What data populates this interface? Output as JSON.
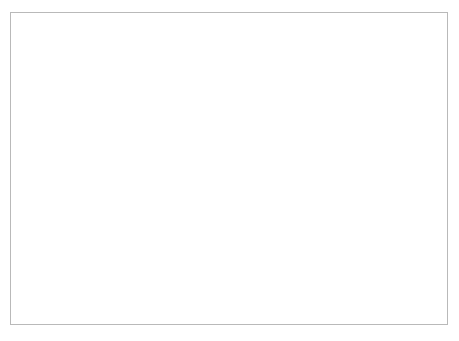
{
  "chart_data": {
    "type": "line",
    "title": "",
    "xlabel": "",
    "ylabel": "(g or ml) / person / week",
    "xlim": [
      1974,
      2006
    ],
    "ylim": [
      0,
      3500
    ],
    "yticks": [
      "0",
      "500",
      "1,000",
      "1,500",
      "2,000",
      "2,500",
      "3,000",
      "3,500"
    ],
    "ytick_values": [
      0,
      500,
      1000,
      1500,
      2000,
      2500,
      3000,
      3500
    ],
    "xticks": [
      "1974",
      "1976",
      "1978",
      "1980",
      "1982",
      "1984",
      "1986",
      "1988",
      "1990",
      "1992",
      "1994",
      "1996",
      "1998",
      "2000",
      "2002",
      "2004",
      "2006"
    ],
    "xtick_values": [
      1974,
      1976,
      1978,
      1980,
      1982,
      1984,
      1986,
      1988,
      1990,
      1992,
      1994,
      1996,
      1998,
      2000,
      2002,
      2004,
      2006
    ],
    "minor_xticks": [
      1975,
      1977,
      1979,
      1981,
      1983,
      1985,
      1987,
      1989,
      1991,
      1993,
      1995,
      1997,
      1999,
      2001,
      2003,
      2005
    ],
    "grid": false,
    "legend_position": "inline-labels",
    "x": [
      1974,
      1975,
      1976,
      1977,
      1978,
      1979,
      1980,
      1981,
      1982,
      1983,
      1984,
      1985,
      1986,
      1987,
      1988,
      1989,
      1990,
      1991,
      1992,
      1993,
      1994,
      1995,
      1996,
      1997,
      1998,
      1999,
      2000,
      2001,
      2002,
      2003,
      2004,
      2005,
      2006
    ],
    "series": [
      {
        "name": "All dairy products",
        "label": "All dairy products",
        "label_x": 1978.0,
        "label_y": 3050,
        "values": [
          3040,
          3060,
          3030,
          2960,
          2900,
          2840,
          2790,
          2740,
          2690,
          2640,
          2590,
          2590,
          2480,
          2470,
          2430,
          2390,
          2340,
          2250,
          2260,
          2340,
          2310,
          2290,
          2270,
          2230,
          2170,
          2120,
          2190,
          2110,
          2040,
          2060,
          2020,
          2030,
          2030
        ]
      },
      {
        "name": "Whole milk",
        "label": "Whole milk",
        "label_x": 1976.4,
        "label_y": 2400,
        "values": [
          2680,
          2710,
          2680,
          2610,
          2540,
          2470,
          2400,
          2320,
          2270,
          2170,
          2060,
          1870,
          1700,
          1570,
          1450,
          1330,
          1220,
          1110,
          990,
          880,
          830,
          780,
          730,
          700,
          660,
          610,
          640,
          570,
          530,
          540,
          430,
          430,
          440
        ]
      },
      {
        "name": "Skimmed / semi-skimmed milk",
        "label": "Skimmed / semi-skimmed milk",
        "label_x": 2005.6,
        "label_y": 1210,
        "label_anchor": "end",
        "values": [
          10,
          10,
          10,
          10,
          10,
          15,
          20,
          25,
          40,
          80,
          170,
          290,
          400,
          470,
          560,
          650,
          760,
          870,
          960,
          1030,
          1060,
          1080,
          1090,
          1120,
          1090,
          1090,
          1110,
          1060,
          1050,
          1040,
          1070,
          1100,
          1080
        ]
      },
      {
        "name": "Cheese and yoghurt",
        "label": "Cheese and yoghurt",
        "label_x": 1998.8,
        "label_y": 420,
        "label_anchor": "end",
        "values": [
          140,
          140,
          140,
          140,
          140,
          145,
          150,
          155,
          165,
          175,
          185,
          190,
          195,
          200,
          205,
          215,
          225,
          235,
          250,
          255,
          255,
          255,
          255,
          255,
          255,
          260,
          270,
          290,
          310,
          320,
          330,
          340,
          350
        ]
      },
      {
        "name": "Butter",
        "label": "Butter",
        "label_x": 2005.8,
        "label_y": 130,
        "label_anchor": "end",
        "values": [
          150,
          150,
          145,
          140,
          135,
          130,
          125,
          120,
          110,
          95,
          75,
          60,
          55,
          50,
          45,
          42,
          40,
          38,
          35,
          33,
          31,
          30,
          29,
          28,
          27,
          26,
          25,
          24,
          23,
          22,
          21,
          20,
          20
        ]
      }
    ]
  }
}
